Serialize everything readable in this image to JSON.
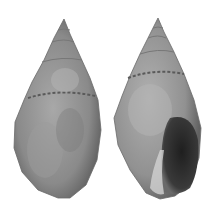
{
  "image": {
    "subject": "Two views of a gastropod shell",
    "views": [
      {
        "label": "dorsal view",
        "position": "left"
      },
      {
        "label": "apertural view",
        "position": "right"
      }
    ],
    "colors": {
      "background": "#ffffff",
      "shell_base": "#8e8e8e",
      "shell_light": "#b4b4b4",
      "shell_dark": "#5a5a5a",
      "aperture": "#2e2e2e"
    }
  }
}
